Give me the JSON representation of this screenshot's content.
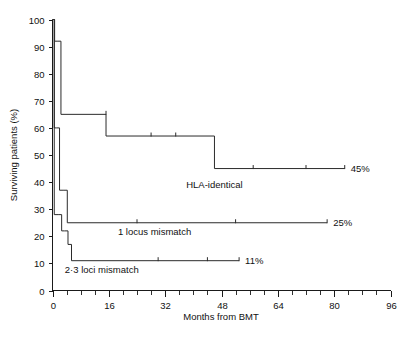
{
  "chart_data": {
    "type": "line",
    "title": "",
    "xlabel": "Months from BMT",
    "ylabel": "Surviving patients (%)",
    "xlim": [
      0,
      96
    ],
    "ylim": [
      0,
      100
    ],
    "xticks": [
      0,
      16,
      32,
      48,
      64,
      80,
      96
    ],
    "xtick_labels": [
      "0",
      "16",
      "32",
      "48",
      "64",
      "80",
      "96"
    ],
    "x_minor_tick_interval": 4,
    "yticks": [
      0,
      10,
      20,
      30,
      40,
      50,
      60,
      70,
      80,
      90,
      100
    ],
    "ytick_labels": [
      "0",
      "10",
      "20",
      "30",
      "40",
      "50",
      "60",
      "70",
      "80",
      "90",
      "100"
    ],
    "grid": false,
    "legend_position": "inline-annotations",
    "step_interpolation": "post",
    "series": [
      {
        "name": "HLA-identical",
        "label": "HLA-identical",
        "endpoint_label": "45%",
        "final_value": 45,
        "label_x": 46,
        "label_y": 38,
        "x": [
          0,
          0.6,
          1.3,
          2.4,
          15.2,
          46.0,
          83.0
        ],
        "y": [
          100,
          92,
          92,
          65,
          57,
          45,
          45
        ],
        "censor_marks": [
          {
            "x": 15.2,
            "y": 65
          },
          {
            "x": 28.0,
            "y": 57
          },
          {
            "x": 35.0,
            "y": 57
          },
          {
            "x": 57.0,
            "y": 45
          },
          {
            "x": 72.0,
            "y": 45
          }
        ]
      },
      {
        "name": "1 locus mismatch",
        "label": "1 locus mismatch",
        "endpoint_label": "25%",
        "final_value": 25,
        "label_x": 29,
        "label_y": 20.5,
        "x": [
          0,
          0.5,
          1.1,
          2.0,
          3.0,
          4.2,
          78.0
        ],
        "y": [
          100,
          60,
          60,
          37,
          37,
          25,
          25
        ],
        "censor_marks": [
          {
            "x": 24.0,
            "y": 25
          },
          {
            "x": 52.0,
            "y": 25
          }
        ]
      },
      {
        "name": "2-3 loci mismatch",
        "label": "2·3 loci mismatch",
        "endpoint_label": "11%",
        "final_value": 11,
        "label_x": 14,
        "label_y": 6.5,
        "x": [
          0,
          0.5,
          1.6,
          2.6,
          3.4,
          4.4,
          5.4,
          53.0
        ],
        "y": [
          100,
          28,
          28,
          22,
          22,
          17,
          11,
          11
        ],
        "censor_marks": [
          {
            "x": 30.0,
            "y": 11
          },
          {
            "x": 44.0,
            "y": 11
          }
        ]
      }
    ]
  },
  "figure": {
    "y_axis_title": "Surviving patients (%)",
    "x_axis_title": "Months from BMT"
  }
}
